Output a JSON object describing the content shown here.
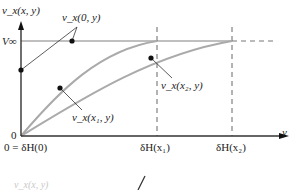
{
  "figure": {
    "y_axis_label": "v_x(x, y)",
    "x_axis_label": "y",
    "freestream_label": "V∞",
    "origin_label": "0",
    "annotations": {
      "leading_edge": "v_x(0, y)",
      "station_1": "v_x(x₁, y)",
      "station_2": "v_x(x₂, y)"
    },
    "x_ticks": [
      {
        "label": "0 = δH(0)"
      },
      {
        "label": "δH(x₁)"
      },
      {
        "label": "δH(x₂)"
      }
    ],
    "colors": {
      "axis": "#333333",
      "curve": "#aaaaaa",
      "freestream_line": "#aaaaaa",
      "dashed": "#666666",
      "point": "#111111"
    },
    "cropped_fragment_label": "v_x(x, y)"
  }
}
